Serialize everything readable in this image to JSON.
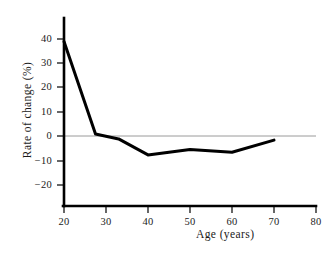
{
  "chart_data": {
    "type": "line",
    "title": "",
    "xlabel": "Age (years)",
    "ylabel": "Rate of change (%)",
    "xlim": [
      18,
      80
    ],
    "ylim": [
      -29,
      46
    ],
    "xticks": [
      20,
      30,
      40,
      50,
      60,
      70,
      80
    ],
    "xtick_labels": [
      "20",
      "30",
      "40",
      "50",
      "60",
      "70",
      "80"
    ],
    "yticks": [
      -20,
      -10,
      0,
      10,
      20,
      30,
      40
    ],
    "ytick_labels": [
      "−20",
      "−10",
      "0",
      "10",
      "20",
      "30",
      "40"
    ],
    "grid": false,
    "zero_line": true,
    "zero_line_color": "#9a9a9a",
    "legend": "none",
    "series": [
      {
        "name": "Rate of change",
        "color": "#000000",
        "line_width": 3,
        "x": [
          20,
          27.5,
          33,
          40,
          50,
          60,
          70
        ],
        "values": [
          39,
          0.8,
          -1.2,
          -7.8,
          -5.6,
          -6.7,
          -1.7
        ]
      }
    ]
  },
  "axis": {
    "line_color": "#000000",
    "tick_color": "#000000"
  }
}
